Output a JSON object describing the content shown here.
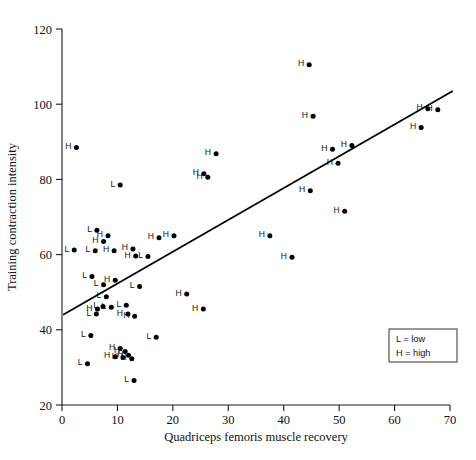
{
  "chart_data": {
    "type": "scatter",
    "title": "",
    "xlabel": "Quadriceps femoris muscle recovery",
    "ylabel": "Training contraction intensity",
    "xlim": [
      0,
      70
    ],
    "ylim": [
      20,
      120
    ],
    "xticks": [
      0,
      10,
      20,
      30,
      40,
      50,
      60,
      70
    ],
    "yticks": [
      20,
      40,
      60,
      80,
      100,
      120
    ],
    "grid": false,
    "legend": {
      "position": "bottom-right",
      "entries": [
        {
          "symbol": "L",
          "separator": "=",
          "label": "low"
        },
        {
          "symbol": "H",
          "separator": "=",
          "label": "high"
        }
      ]
    },
    "marker_color": "#000000",
    "line_color": "#000000",
    "trend_line": {
      "label": "regression line",
      "x_start": 0.2,
      "y_start": 44.0,
      "x_end": 70.5,
      "y_end": 103.5
    },
    "series": [
      {
        "name": "low",
        "code": "L",
        "points": [
          {
            "x": 10.5,
            "y": 78.5
          },
          {
            "x": 6.3,
            "y": 66.5
          },
          {
            "x": 2.2,
            "y": 61.2
          },
          {
            "x": 6.0,
            "y": 61.0
          },
          {
            "x": 5.4,
            "y": 54.2
          },
          {
            "x": 7.5,
            "y": 52.0
          },
          {
            "x": 8.0,
            "y": 48.8
          },
          {
            "x": 7.4,
            "y": 46.2
          },
          {
            "x": 8.9,
            "y": 46.0
          },
          {
            "x": 11.6,
            "y": 46.5
          },
          {
            "x": 6.2,
            "y": 44.2
          },
          {
            "x": 14.0,
            "y": 51.5
          },
          {
            "x": 15.5,
            "y": 59.5
          },
          {
            "x": 5.2,
            "y": 38.5
          },
          {
            "x": 17.0,
            "y": 38.0
          },
          {
            "x": 4.6,
            "y": 31.0
          },
          {
            "x": 13.0,
            "y": 26.5
          }
        ]
      },
      {
        "name": "high",
        "code": "H",
        "points": [
          {
            "x": 2.6,
            "y": 88.5
          },
          {
            "x": 44.6,
            "y": 110.5
          },
          {
            "x": 45.3,
            "y": 96.8
          },
          {
            "x": 64.8,
            "y": 93.8
          },
          {
            "x": 66.0,
            "y": 98.8
          },
          {
            "x": 67.8,
            "y": 98.5
          },
          {
            "x": 52.3,
            "y": 89.0
          },
          {
            "x": 48.8,
            "y": 88.0
          },
          {
            "x": 49.8,
            "y": 84.3
          },
          {
            "x": 44.8,
            "y": 77.0
          },
          {
            "x": 27.8,
            "y": 86.8
          },
          {
            "x": 25.6,
            "y": 81.5
          },
          {
            "x": 26.3,
            "y": 80.6
          },
          {
            "x": 51.0,
            "y": 71.5
          },
          {
            "x": 37.5,
            "y": 65.0
          },
          {
            "x": 41.5,
            "y": 59.3
          },
          {
            "x": 20.2,
            "y": 65.0
          },
          {
            "x": 17.5,
            "y": 64.5
          },
          {
            "x": 8.3,
            "y": 65.0
          },
          {
            "x": 7.5,
            "y": 63.5
          },
          {
            "x": 9.4,
            "y": 61.0
          },
          {
            "x": 12.8,
            "y": 61.5
          },
          {
            "x": 13.3,
            "y": 59.6
          },
          {
            "x": 9.6,
            "y": 53.2
          },
          {
            "x": 6.4,
            "y": 45.5
          },
          {
            "x": 11.9,
            "y": 44.2
          },
          {
            "x": 13.1,
            "y": 43.6
          },
          {
            "x": 25.5,
            "y": 45.5
          },
          {
            "x": 22.5,
            "y": 49.5
          },
          {
            "x": 10.5,
            "y": 35.0
          },
          {
            "x": 11.4,
            "y": 34.2
          },
          {
            "x": 12.0,
            "y": 33.2
          },
          {
            "x": 11.0,
            "y": 32.6
          },
          {
            "x": 12.6,
            "y": 32.3
          },
          {
            "x": 9.6,
            "y": 32.8
          }
        ]
      }
    ]
  }
}
